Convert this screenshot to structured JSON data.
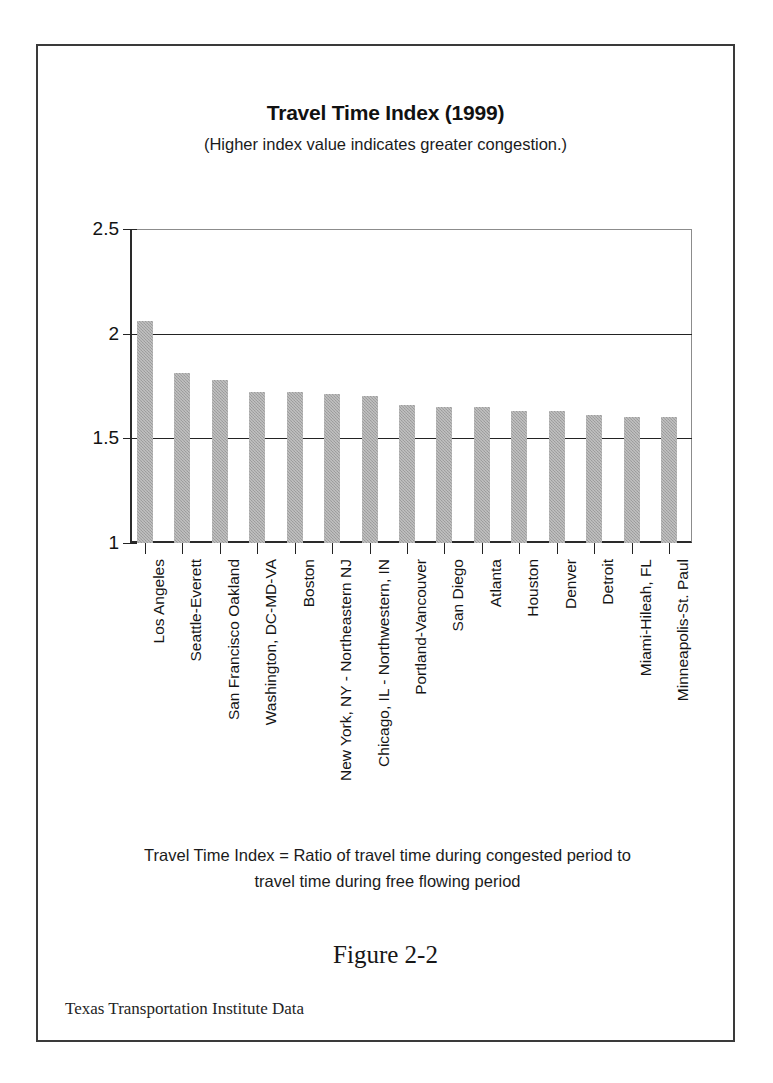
{
  "figure": {
    "caption": "Figure 2-2",
    "source_note": "Texas Transportation Institute Data",
    "footnote_line1": "Travel Time Index = Ratio of travel time during congested period to",
    "footnote_line2": "travel time during free flowing period"
  },
  "chart_data": {
    "type": "bar",
    "title": "Travel Time Index (1999)",
    "subtitle": "(Higher index value indicates greater congestion.)",
    "xlabel": "",
    "ylabel": "",
    "ylim": [
      1,
      2.5
    ],
    "yticks": [
      "1",
      "1.5",
      "2",
      "2.5"
    ],
    "ytick_values": [
      1,
      1.5,
      2,
      2.5
    ],
    "gridlines": [
      1.5,
      2
    ],
    "grid": true,
    "legend": null,
    "bar_color": "#a5a5a5",
    "categories": [
      "Los Angeles",
      "Seattle-Everett",
      "San Francisco Oakland",
      "Washington, DC-MD-VA",
      "Boston",
      "New York, NY - Northeastern NJ",
      "Chicago, IL - Northwestern, IN",
      "Portland-Vancouver",
      "San Diego",
      "Atlanta",
      "Houston",
      "Denver",
      "Detroit",
      "Miami-Hileah, FL",
      "Minneapolis-St. Paul"
    ],
    "values": [
      2.06,
      1.81,
      1.78,
      1.72,
      1.72,
      1.71,
      1.7,
      1.66,
      1.65,
      1.65,
      1.63,
      1.63,
      1.61,
      1.6,
      1.6
    ]
  }
}
